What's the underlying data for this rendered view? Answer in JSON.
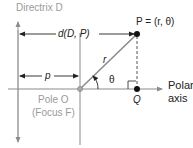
{
  "labels": {
    "directrix": "Directrix D",
    "distance": "d(D, P)",
    "point_p": "P = (r, θ)",
    "r": "r",
    "theta": "θ",
    "p": "p",
    "pole": "Pole O",
    "focus": "(Focus F)",
    "q": "Q",
    "polar_axis_1": "Polar",
    "polar_axis_2": "axis"
  },
  "colors": {
    "line": "#8c8c8c",
    "dark": "#222222",
    "light_text": "#9a9a9a"
  }
}
